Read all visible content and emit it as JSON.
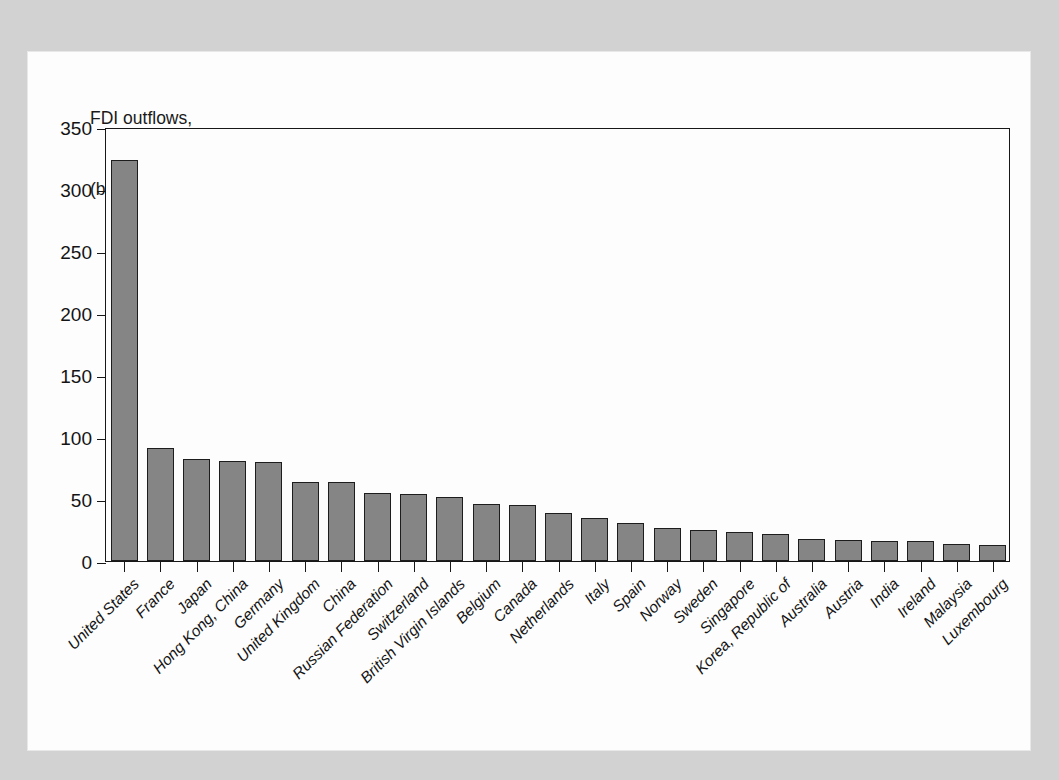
{
  "caption": {
    "line1": "FDI outflows,",
    "line2": "(billions of U.S. dollars)"
  },
  "colors": {
    "bar_fill": "#858585",
    "bar_border": "#1d1d1d",
    "axis": "#171717",
    "panel": "#fdfdfd",
    "page_background": "#d2d2d2",
    "text": "#141414"
  },
  "chart_data": {
    "type": "bar",
    "title": "FDI outflows, (billions of U.S. dollars)",
    "xlabel": "",
    "ylabel": "FDI outflows, (billions of U.S. dollars)",
    "ylim": [
      0,
      350
    ],
    "yticks": [
      0,
      50,
      100,
      150,
      200,
      250,
      300,
      350
    ],
    "ytick_labels": [
      "0",
      "50",
      "100",
      "150",
      "200",
      "250",
      "300",
      "350"
    ],
    "grid": false,
    "legend": false,
    "categories": [
      "United States",
      "France",
      "Japan",
      "Hong Kong, China",
      "Germany",
      "United Kingdom",
      "China",
      "Russian Federation",
      "Switzerland",
      "British Virgin Islands",
      "Belgium",
      "Canada",
      "Netherlands",
      "Italy",
      "Spain",
      "Norway",
      "Sweden",
      "Singapore",
      "Korea, Republic of",
      "Australia",
      "Austria",
      "India",
      "Ireland",
      "Malaysia",
      "Luxembourg"
    ],
    "values": [
      323,
      91,
      82,
      81,
      80,
      64,
      64,
      55,
      54,
      52,
      46,
      45,
      39,
      35,
      31,
      27,
      25,
      23,
      22,
      18,
      17,
      16,
      16,
      14,
      13
    ]
  }
}
